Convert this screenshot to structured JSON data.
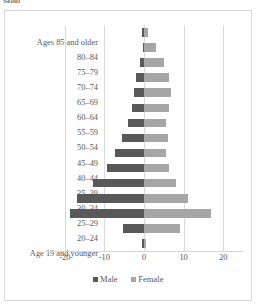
{
  "caption": "Seoul",
  "chart_data": {
    "type": "bar",
    "subtype": "population-pyramid",
    "title": "",
    "xlabel": "",
    "ylabel": "",
    "xlim": [
      -25,
      25
    ],
    "xticks": [
      -20,
      -10,
      0,
      10,
      20
    ],
    "xtick_labels": [
      "-20",
      "-10",
      "0",
      "10",
      "20"
    ],
    "grid": true,
    "legend_position": "bottom",
    "categories": [
      "Ages 85 and older",
      "80–84",
      "75–79",
      "70–74",
      "65–69",
      "60–64",
      "55–59",
      "50–54",
      "45–49",
      "40–44",
      "35–39",
      "30–34",
      "25–29",
      "20–24",
      "Age 19 and younger"
    ],
    "series": [
      {
        "name": "Male",
        "color": "#595959",
        "values": [
          -0.4,
          -0.2,
          -1.0,
          -2.0,
          -2.6,
          -3.0,
          -4.0,
          -5.6,
          -7.2,
          -9.4,
          -13.0,
          -16.8,
          -18.7,
          -5.2,
          -0.5
        ]
      },
      {
        "name": "Female",
        "color": "#a6a6a6",
        "values": [
          1.0,
          3.0,
          5.0,
          6.2,
          6.8,
          6.2,
          5.6,
          6.0,
          5.6,
          6.2,
          8.2,
          11.2,
          16.8,
          9.2,
          0.5
        ]
      }
    ]
  },
  "legend": {
    "items": [
      {
        "label": "Male"
      },
      {
        "label": "Female"
      }
    ]
  }
}
